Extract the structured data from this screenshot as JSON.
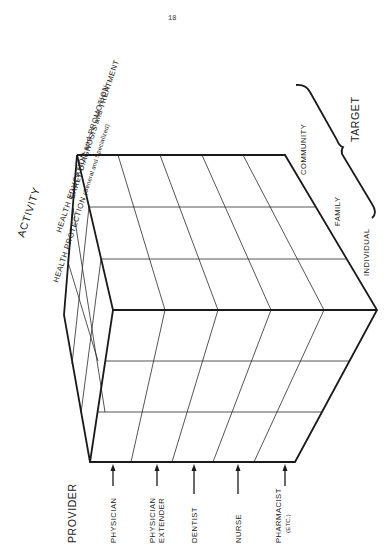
{
  "page": {
    "number": "18"
  },
  "activity": {
    "title": "ACTIVITY",
    "items": [
      {
        "label": "HEALTH  PROTECTION",
        "detail": "(General and Specialized)"
      },
      {
        "label": "HEALTH  EDUCATION and PROMOTION"
      },
      {
        "label": "EARLY  DIAGNOSIS  and  TREATMENT"
      }
    ]
  },
  "provider": {
    "title": "PROVIDER",
    "items": [
      {
        "label": "PHYSICIAN"
      },
      {
        "label": "PHYSICIAN",
        "label2": "EXTENDER"
      },
      {
        "label": "DENTIST"
      },
      {
        "label": "NURSE"
      },
      {
        "label": "PHARMACIST",
        "label2": "(ETC.)"
      }
    ]
  },
  "target": {
    "title": "TARGET",
    "items": [
      {
        "label": "COMMUNITY"
      },
      {
        "label": "FAMILY"
      },
      {
        "label": "INDIVIDUAL"
      }
    ]
  },
  "colors": {
    "ink": "#1a1a1a",
    "paper": "#ffffff"
  }
}
